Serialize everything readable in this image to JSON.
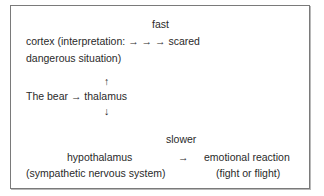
{
  "diagram": {
    "type": "flow",
    "labels": {
      "fast": "fast",
      "cortex_line1": "cortex (interpretation: → → → scared",
      "cortex_line2": "dangerous situation)",
      "arrow_up": "↑",
      "bear_thalamus": "The bear → thalamus",
      "arrow_down": "↓",
      "slower": "slower",
      "hypothalamus": "hypothalamus",
      "hypothalamus_sub": "(sympathetic nervous system)",
      "arrow_right": "→",
      "emotional_reaction": "emotional reaction",
      "emotional_sub": "(fight or flight)"
    },
    "nodes": [
      "The bear",
      "thalamus",
      "cortex",
      "scared",
      "hypothalamus",
      "emotional reaction"
    ],
    "edges": [
      {
        "from": "The bear",
        "to": "thalamus"
      },
      {
        "from": "thalamus",
        "to": "cortex",
        "label": "fast"
      },
      {
        "from": "cortex",
        "to": "scared"
      },
      {
        "from": "thalamus",
        "to": "hypothalamus",
        "label": "slower"
      },
      {
        "from": "hypothalamus",
        "to": "emotional reaction"
      }
    ],
    "colors": {
      "text": "#2a2a2a",
      "border": "#7a7a7a"
    }
  }
}
